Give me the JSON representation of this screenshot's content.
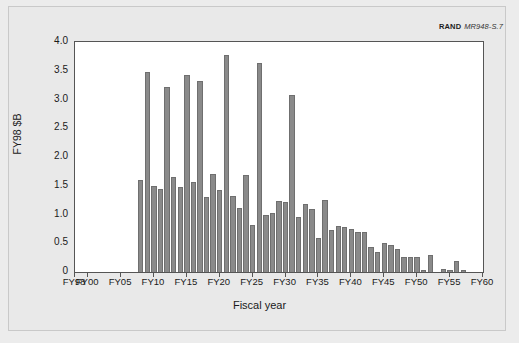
{
  "credit": {
    "organization": "RAND",
    "figure_id": "MR948-S.7"
  },
  "chart_data": {
    "type": "bar",
    "title": "",
    "xlabel": "Fiscal year",
    "ylabel": "FY98 $B",
    "ylim": [
      0,
      4.0
    ],
    "xlim": [
      1998,
      2060
    ],
    "grid": false,
    "legend": "none",
    "bar_color": "#8a8a8a",
    "ytick_labels": [
      "0",
      "0.5",
      "1.0",
      "1.5",
      "2.0",
      "2.5",
      "3.0",
      "3.5",
      "4.0"
    ],
    "ytick_values": [
      0,
      0.5,
      1.0,
      1.5,
      2.0,
      2.5,
      3.0,
      3.5,
      4.0
    ],
    "xtick_labels": [
      "FY98",
      "FY00",
      "FY05",
      "FY10",
      "FY15",
      "FY20",
      "FY25",
      "FY30",
      "FY35",
      "FY40",
      "FY45",
      "FY50",
      "FY55",
      "FY60"
    ],
    "xtick_values": [
      1998,
      2000,
      2005,
      2010,
      2015,
      2020,
      2025,
      2030,
      2035,
      2040,
      2045,
      2050,
      2055,
      2060
    ],
    "categories": [
      "FY08",
      "FY09",
      "FY10",
      "FY11",
      "FY12",
      "FY13",
      "FY14",
      "FY15",
      "FY16",
      "FY17",
      "FY18",
      "FY19",
      "FY20",
      "FY21",
      "FY22",
      "FY23",
      "FY24",
      "FY25",
      "FY26",
      "FY27",
      "FY28",
      "FY29",
      "FY30",
      "FY31",
      "FY32",
      "FY33",
      "FY34",
      "FY35",
      "FY36",
      "FY37",
      "FY38",
      "FY39",
      "FY40",
      "FY41",
      "FY42",
      "FY43",
      "FY44",
      "FY45",
      "FY46",
      "FY47",
      "FY48",
      "FY49",
      "FY50",
      "FY51",
      "FY52",
      "FY53",
      "FY54",
      "FY55",
      "FY56",
      "FY57"
    ],
    "x": [
      2008,
      2009,
      2010,
      2011,
      2012,
      2013,
      2014,
      2015,
      2016,
      2017,
      2018,
      2019,
      2020,
      2021,
      2022,
      2023,
      2024,
      2025,
      2026,
      2027,
      2028,
      2029,
      2030,
      2031,
      2032,
      2033,
      2034,
      2035,
      2036,
      2037,
      2038,
      2039,
      2040,
      2041,
      2042,
      2043,
      2044,
      2045,
      2046,
      2047,
      2048,
      2049,
      2050,
      2051,
      2052,
      2053,
      2054,
      2055,
      2056,
      2057
    ],
    "values": [
      1.6,
      3.47,
      1.5,
      1.45,
      3.22,
      1.66,
      1.48,
      3.43,
      1.57,
      3.33,
      1.3,
      1.71,
      1.43,
      3.78,
      1.32,
      1.12,
      1.69,
      0.81,
      3.64,
      1.0,
      1.02,
      1.23,
      1.22,
      3.07,
      0.95,
      1.19,
      1.09,
      0.59,
      1.25,
      0.73,
      0.8,
      0.78,
      0.75,
      0.69,
      0.69,
      0.44,
      0.35,
      0.51,
      0.47,
      0.4,
      0.26,
      0.26,
      0.26,
      0.03,
      0.3,
      0.0,
      0.05,
      0.04,
      0.19,
      0.04
    ]
  }
}
